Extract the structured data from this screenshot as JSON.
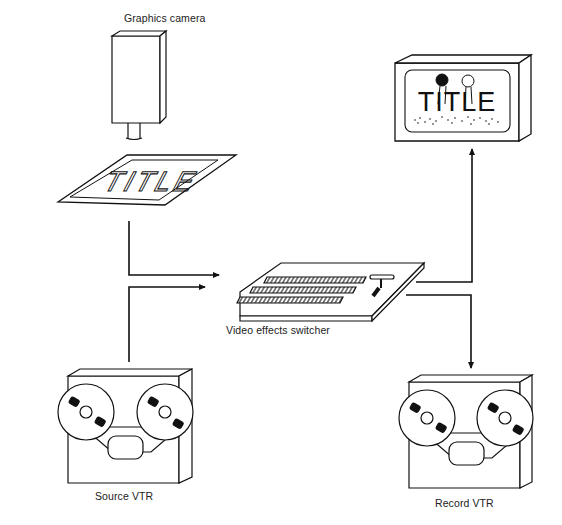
{
  "diagram": {
    "type": "signal-flow",
    "nodes": {
      "graphics_camera": {
        "label": "Graphics camera"
      },
      "title_card": {
        "text": "TITLE"
      },
      "video_effects_switcher": {
        "label": "Video effects switcher"
      },
      "monitor": {
        "text": "TITLE"
      },
      "source_vtr": {
        "label": "Source VTR"
      },
      "record_vtr": {
        "label": "Record VTR"
      }
    },
    "edges": [
      {
        "from": "title_card",
        "to": "video_effects_switcher"
      },
      {
        "from": "source_vtr",
        "to": "video_effects_switcher"
      },
      {
        "from": "video_effects_switcher",
        "to": "monitor"
      },
      {
        "from": "video_effects_switcher",
        "to": "record_vtr"
      }
    ],
    "colors": {
      "line": "#111111",
      "background": "#ffffff"
    }
  }
}
